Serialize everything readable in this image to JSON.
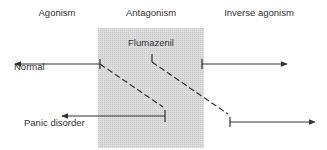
{
  "headers": {
    "agonism": "Agonism",
    "antagonism": "Antagonism",
    "inverse": "Inverse agonism"
  },
  "labels": {
    "flumazenil": "Flumazenil",
    "normal": "Normal",
    "panic": "Panic disorder"
  },
  "colors": {
    "box": "#d6d6d6",
    "line": "#333333"
  }
}
